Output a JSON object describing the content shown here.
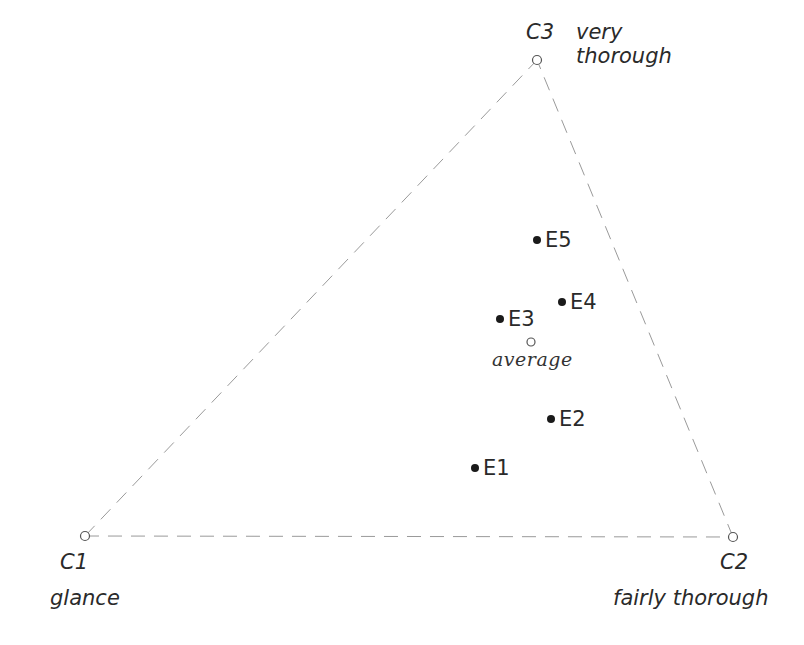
{
  "diagram": {
    "type": "ternary-triangle",
    "vertices": [
      {
        "id": "C1",
        "label": "C1",
        "description": "glance",
        "x": 85,
        "y": 536
      },
      {
        "id": "C2",
        "label": "C2",
        "description": "fairly thorough",
        "x": 733,
        "y": 537
      },
      {
        "id": "C3",
        "label": "C3",
        "description_line1": "very",
        "description_line2": "thorough",
        "x": 537,
        "y": 60
      }
    ],
    "points": [
      {
        "label": "E1",
        "x": 475,
        "y": 468
      },
      {
        "label": "E2",
        "x": 551,
        "y": 419
      },
      {
        "label": "E3",
        "x": 500,
        "y": 319
      },
      {
        "label": "E4",
        "x": 562,
        "y": 302
      },
      {
        "label": "E5",
        "x": 537,
        "y": 240
      }
    ],
    "average": {
      "label": "average",
      "x": 531,
      "y": 342
    },
    "colors": {
      "edge": "#9a9a9a",
      "point": "#1a1a1a",
      "text": "#2a2a2a"
    }
  }
}
